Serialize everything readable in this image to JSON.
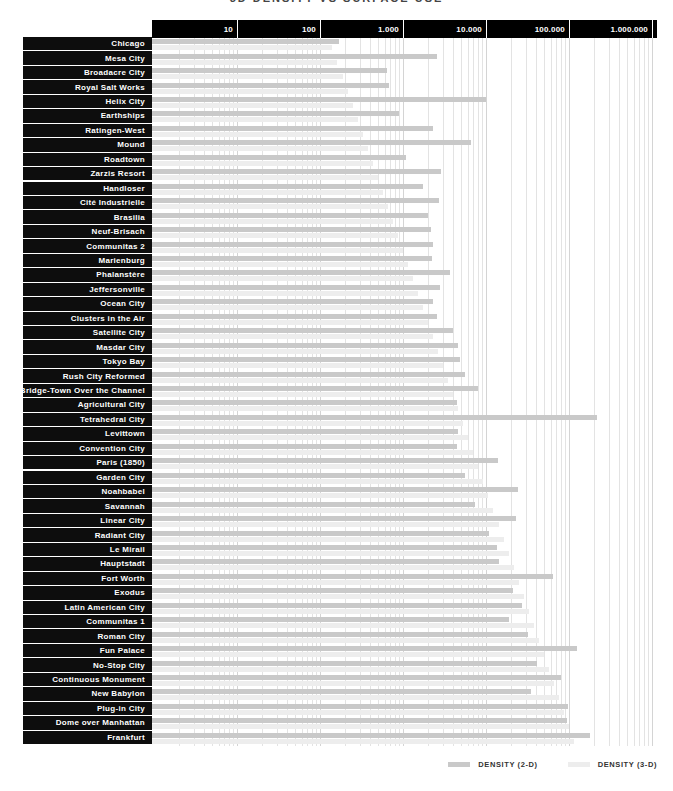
{
  "title": "3D DENSITY VS SURFACE USE",
  "legend": {
    "d2_label": "DENSITY (2-D)",
    "d3_label": "DENSITY (3-D)"
  },
  "colors": {
    "d2": "#c9c9c9",
    "d3": "#ededed",
    "header_bg": "#000000",
    "row_label_bg": "#0d0d0d",
    "row_label_text": "#ffffff",
    "title_text": "#444444",
    "gridline_minor": "rgba(0,0,0,0.11)",
    "gridline_major": "rgba(0,0,0,0.17)"
  },
  "chart_data": {
    "type": "bar",
    "orientation": "horizontal",
    "x_scale": "log",
    "x_range": [
      1,
      1000000
    ],
    "x_ticks": [
      "10",
      "100",
      "1.000",
      "10.000",
      "100.000",
      "1.000.000"
    ],
    "grid": "minor-log-verticals",
    "legend_position": "bottom-right",
    "title": "3D DENSITY VS SURFACE USE",
    "categories": [
      "Chicago",
      "Mesa City",
      "Broadacre City",
      "Royal Salt Works",
      "Helix City",
      "Earthships",
      "Ratingen-West",
      "Mound",
      "Roadtown",
      "Zarzis Resort",
      "Handloser",
      "Cité Industrielle",
      "Brasilia",
      "Neuf-Brisach",
      "Communitas 2",
      "Marienburg",
      "Phalanstère",
      "Jeffersonville",
      "Ocean City",
      "Clusters in the Air",
      "Satellite City",
      "Masdar City",
      "Tokyo Bay",
      "Rush City Reformed",
      "Bridge-Town Over the Channel",
      "Agricultural City",
      "Tetrahedral City",
      "Levittown",
      "Convention City",
      "Paris (1850)",
      "Garden City",
      "Noahbabel",
      "Savannah",
      "Linear City",
      "Radiant City",
      "Le Mirail",
      "Hauptstadt",
      "Fort Worth",
      "Exodus",
      "Latin American City",
      "Communitas 1",
      "Roman City",
      "Fun Palace",
      "No-Stop City",
      "Continuous Monument",
      "New Babylon",
      "Plug-in City",
      "Dome over Manhattan",
      "Frankfurt"
    ],
    "series": [
      {
        "name": "DENSITY (2-D)",
        "color": "#c9c9c9",
        "values": [
          170,
          2600,
          650,
          680,
          10000,
          900,
          2300,
          6600,
          1100,
          2900,
          1750,
          2700,
          2000,
          2200,
          2300,
          2250,
          3700,
          2800,
          2300,
          2600,
          4000,
          4600,
          4900,
          5600,
          8000,
          4500,
          220000,
          4600,
          4500,
          14000,
          5600,
          24000,
          7400,
          23000,
          11000,
          13500,
          14500,
          64000,
          21000,
          27000,
          19000,
          32000,
          125000,
          41000,
          81000,
          35000,
          96000,
          95000,
          180000
        ]
      },
      {
        "name": "DENSITY (3-D)",
        "color": "#ededed",
        "values": [
          140,
          160,
          190,
          215,
          250,
          285,
          330,
          375,
          430,
          500,
          570,
          660,
          755,
          870,
          1000,
          1150,
          1320,
          1500,
          1750,
          2000,
          2300,
          2650,
          3050,
          3500,
          4000,
          4650,
          5300,
          6100,
          7000,
          8100,
          9300,
          10700,
          12300,
          14200,
          16300,
          18700,
          21500,
          24800,
          28500,
          32700,
          37600,
          43300,
          49800,
          57200,
          65800,
          75600,
          87000,
          100000,
          115000
        ]
      }
    ]
  }
}
